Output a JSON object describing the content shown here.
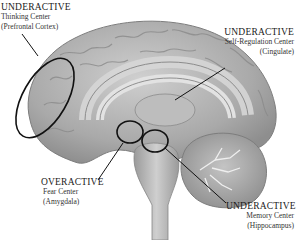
{
  "diagram": {
    "type": "brain-sagittal-section",
    "annotations": [
      {
        "id": "prefrontal",
        "status": "UNDERACTIVE",
        "region": "Thinking Center",
        "area": "(Prefrontal Cortex)"
      },
      {
        "id": "cingulate",
        "status": "UNDERACTIVE",
        "region": "Self-Regulation Center",
        "area": "(Cingulate)"
      },
      {
        "id": "amygdala",
        "status": "OVERACTIVE",
        "region": "Fear Center",
        "area": "(Amygdala)"
      },
      {
        "id": "hippocampus",
        "status": "UNDERACTIVE",
        "region": "Memory Center",
        "area": "(Hippocampus)"
      }
    ],
    "colors": {
      "brain_fill": "#b5b5b5",
      "brain_dark": "#8a8a8a",
      "brain_light": "#d8d8d8",
      "outline": "#111111"
    }
  }
}
